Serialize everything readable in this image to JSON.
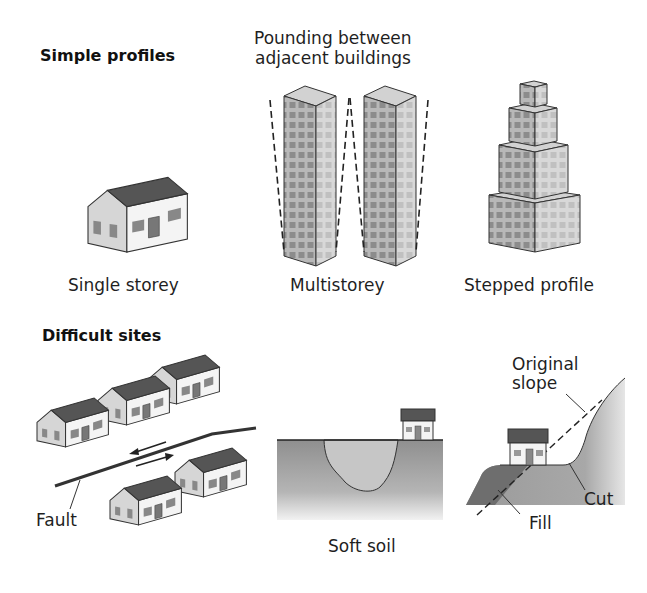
{
  "sections": {
    "simple": {
      "title": "Simple profiles"
    },
    "difficult": {
      "title": "Difficult sites"
    }
  },
  "labels": {
    "pounding_line1": "Pounding between",
    "pounding_line2": "adjacent buildings",
    "single_storey": "Single storey",
    "multistorey": "Multistorey",
    "stepped_profile": "Stepped profile",
    "fault": "Fault",
    "soft_soil": "Soft soil",
    "original_line1": "Original",
    "original_line2": "slope",
    "cut": "Cut",
    "fill": "Fill"
  },
  "colors": {
    "roof": "#5a5a5a",
    "wall_light": "#f4f4f4",
    "wall_shade": "#d4d4d4",
    "window": "#8a8a8a",
    "tower_front": "#a8a8a8",
    "tower_side": "#cfcfcf",
    "ground": "#9a9a9a",
    "soft_soil": "#c4c4c4",
    "fill": "#6e6e6e"
  }
}
